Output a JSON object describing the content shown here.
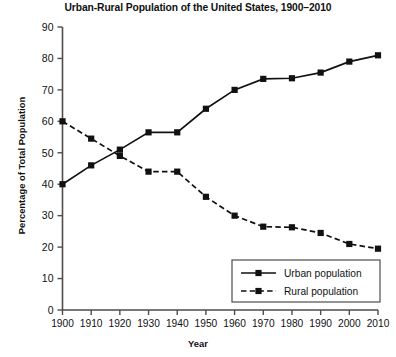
{
  "chart_data": {
    "type": "line",
    "title": "Urban-Rural Population of the United States, 1900–2010",
    "xlabel": "Year",
    "ylabel": "Percentage of Total Population",
    "x": [
      1900,
      1910,
      1920,
      1930,
      1940,
      1950,
      1960,
      1970,
      1980,
      1990,
      2000,
      2010
    ],
    "xtick_labels": [
      "1900",
      "1910",
      "1920",
      "1930",
      "1940",
      "1950",
      "1960",
      "1970",
      "1980",
      "1990",
      "2000",
      "2010"
    ],
    "ytick_labels": [
      "0",
      "10",
      "20",
      "30",
      "40",
      "50",
      "60",
      "70",
      "80",
      "90"
    ],
    "yticks": [
      0,
      10,
      20,
      30,
      40,
      50,
      60,
      70,
      80,
      90
    ],
    "xlim": [
      1900,
      2010
    ],
    "ylim": [
      0,
      90
    ],
    "grid": false,
    "legend_position": "bottom-right",
    "series": [
      {
        "name": "Urban population",
        "style": "solid",
        "marker": "square",
        "color": "#111111",
        "values": [
          40,
          46,
          51,
          56.5,
          56.5,
          64,
          70,
          73.5,
          73.7,
          75.5,
          79,
          81
        ]
      },
      {
        "name": "Rural population",
        "style": "dashed",
        "marker": "square",
        "color": "#111111",
        "values": [
          60,
          54.5,
          49,
          44,
          44,
          36,
          30,
          26.5,
          26.3,
          24.5,
          21,
          19.5
        ]
      }
    ]
  },
  "legend": {
    "entries": [
      {
        "label": "Urban population"
      },
      {
        "label": "Rural population"
      }
    ]
  }
}
